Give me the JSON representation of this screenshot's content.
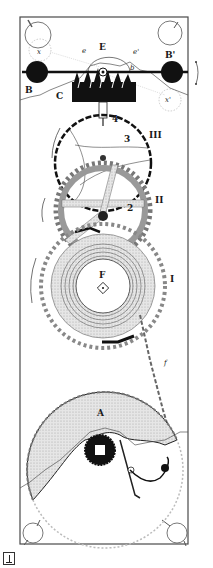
{
  "figure": {
    "type": "technical-illustration",
    "labels": {
      "balance_left": "B",
      "balance_right": "B'",
      "crossing_left": "x",
      "crossing_right": "x'",
      "escapement": "E",
      "pallet_left": "e",
      "pallet_right": "e'",
      "arm": "b",
      "escape_block": "C",
      "pinion_4": "4",
      "pinion_3": "3",
      "wheel_3": "III",
      "pinion_2": "2",
      "wheel_2": "II",
      "barrel": "F",
      "wheel_1": "I",
      "chain": "f",
      "fusee": "A"
    },
    "colors": {
      "ink": "#1a1a1a",
      "stipple": "#cfcfcf",
      "background": "#ffffff",
      "frame": "#4a4a4a"
    }
  }
}
